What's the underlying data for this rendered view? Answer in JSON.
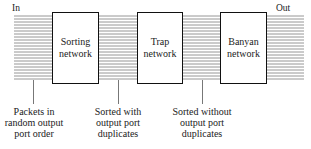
{
  "diagram": {
    "input_label": "In",
    "output_label": "Out",
    "stages": [
      {
        "line1": "Sorting",
        "line2": "network"
      },
      {
        "line1": "Trap",
        "line2": "network"
      },
      {
        "line1": "Banyan",
        "line2": "network"
      }
    ],
    "annotations": [
      {
        "line1": "Packets in",
        "line2": "random output",
        "line3": "port order"
      },
      {
        "line1": "Sorted with",
        "line2": "output port",
        "line3": "duplicates"
      },
      {
        "line1": "Sorted without",
        "line2": "output port",
        "line3": "duplicates"
      }
    ],
    "colors": {
      "line": "#8a8a8a",
      "box_border": "#111111",
      "text": "#222222"
    }
  }
}
